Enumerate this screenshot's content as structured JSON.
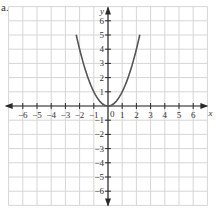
{
  "figure_label": "a.",
  "chart_data": {
    "type": "line",
    "title": "",
    "xlabel": "x",
    "ylabel": "y",
    "xlim": [
      -7,
      7
    ],
    "ylim": [
      -7,
      7
    ],
    "grid": true,
    "x_ticks": [
      -6,
      -5,
      -4,
      -3,
      -2,
      -1,
      0,
      1,
      2,
      3,
      4,
      5,
      6
    ],
    "y_ticks": [
      -6,
      -5,
      -4,
      -3,
      -2,
      -1,
      1,
      2,
      3,
      4,
      5,
      6
    ],
    "origin_label": "0",
    "series": [
      {
        "name": "y = x^2",
        "x": [
          -2.24,
          -2,
          -1.5,
          -1,
          -0.5,
          0,
          0.5,
          1,
          1.5,
          2,
          2.24
        ],
        "y": [
          5,
          4,
          2.25,
          1,
          0.25,
          0,
          0.25,
          1,
          2.25,
          4,
          5
        ]
      }
    ],
    "colors": {
      "curve": "#555555",
      "grid": "#d6d6d6",
      "axis": "#2a2a2a"
    }
  }
}
